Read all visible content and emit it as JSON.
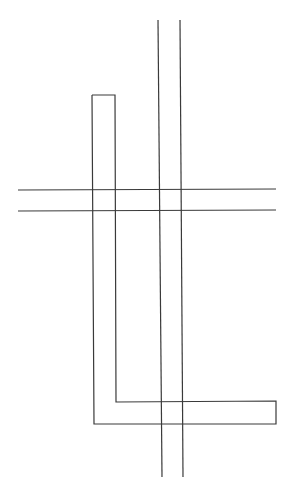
{
  "canvas": {
    "width": 289,
    "height": 498,
    "background": "#ffffff",
    "stroke": "#3a3a3a"
  },
  "diagram": {
    "title": "",
    "vertical_pair": [
      {
        "id": "v1",
        "x1": 158,
        "y1": 20,
        "x2": 162,
        "y2": 477
      },
      {
        "id": "v2",
        "x1": 180,
        "y1": 20,
        "x2": 183,
        "y2": 477
      }
    ],
    "horizontal_pair": [
      {
        "id": "h1",
        "x1": 18,
        "y1": 190,
        "x2": 276,
        "y2": 189
      },
      {
        "id": "h2",
        "x1": 18,
        "y1": 211,
        "x2": 276,
        "y2": 210
      }
    ],
    "l_shape": {
      "id": "L",
      "points": "92,95 115,95 116,402 276,401 276,424 94,424 92,95"
    }
  }
}
